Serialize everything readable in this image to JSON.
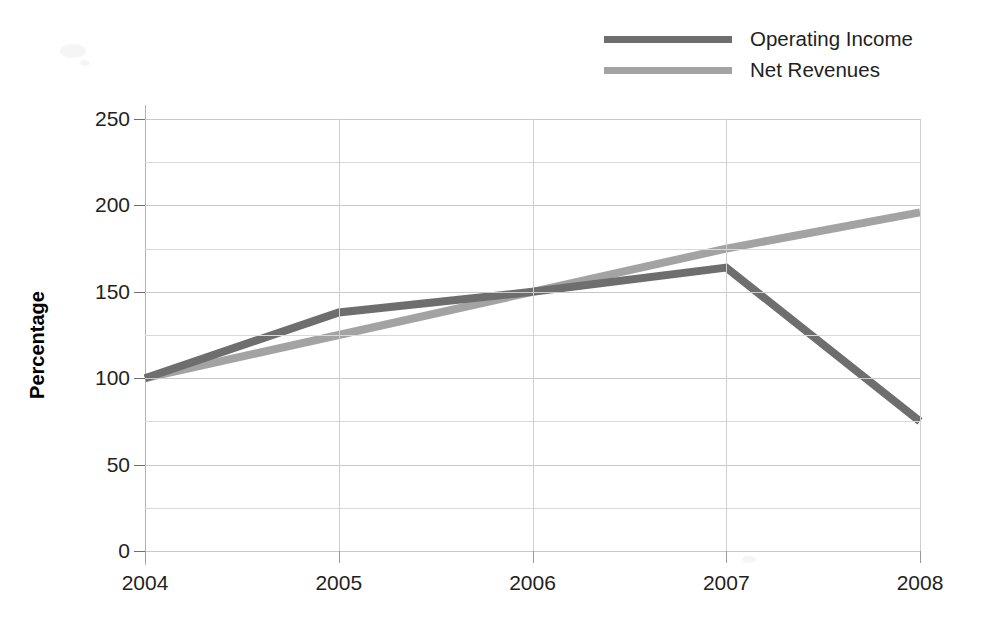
{
  "chart_data": {
    "type": "line",
    "title": "",
    "xlabel": "",
    "ylabel": "Percentage",
    "categories": [
      "2004",
      "2005",
      "2006",
      "2007",
      "2008"
    ],
    "series": [
      {
        "name": "Operating Income",
        "color": "#6e6e6e",
        "values": [
          100,
          138,
          150,
          164,
          75
        ]
      },
      {
        "name": "Net Revenues",
        "color": "#a3a3a3",
        "values": [
          100,
          125,
          150,
          175,
          196
        ]
      }
    ],
    "ylim": [
      0,
      250
    ],
    "ytick_labels": [
      "0",
      "50",
      "100",
      "150",
      "200",
      "250"
    ],
    "ytick_values": [
      0,
      50,
      100,
      150,
      200,
      250
    ],
    "yminor_values": [
      25,
      75,
      125,
      175,
      225
    ],
    "grid": true,
    "legend_position": "top-right"
  },
  "legend": {
    "entries": [
      {
        "label": "Operating Income",
        "color": "#6e6e6e"
      },
      {
        "label": "Net Revenues",
        "color": "#a3a3a3"
      }
    ]
  },
  "axes": {
    "y_title": "Percentage"
  }
}
